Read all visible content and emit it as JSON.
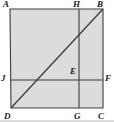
{
  "figure": {
    "name": "geometry-figure-rectangle-with-cevian",
    "type": "plane-geometry-diagram",
    "shape": "quadrilateral ABCD with interior segments",
    "background_color": "#ffffff",
    "fill_color": "#dcdcdc",
    "stroke_color": "#3c3c3c",
    "label_color": "#1a1a1a",
    "outline": {
      "A": {
        "x": 10,
        "y": 9
      },
      "B": {
        "x": 103,
        "y": 9
      },
      "C": {
        "x": 103,
        "y": 108
      },
      "D": {
        "x": 11,
        "y": 108
      }
    },
    "points": [
      {
        "id": "A",
        "label": "A",
        "x": 10,
        "y": 9,
        "label_x": 3,
        "label_y": 0,
        "position": "top-left-vertex"
      },
      {
        "id": "B",
        "label": "B",
        "x": 103,
        "y": 9,
        "label_x": 97,
        "label_y": 0,
        "position": "top-right-vertex"
      },
      {
        "id": "C",
        "label": "C",
        "x": 103,
        "y": 108,
        "label_x": 98,
        "label_y": 113,
        "position": "bottom-right-vertex"
      },
      {
        "id": "D",
        "label": "D",
        "x": 11,
        "y": 108,
        "label_x": 4,
        "label_y": 113,
        "position": "bottom-left-vertex"
      },
      {
        "id": "E",
        "label": "E",
        "x": 79,
        "y": 80,
        "label_x": 70,
        "label_y": 68,
        "position": "interior-intersection"
      },
      {
        "id": "F",
        "label": "F",
        "x": 103,
        "y": 80,
        "label_x": 105,
        "label_y": 75,
        "position": "right-edge-point"
      },
      {
        "id": "G",
        "label": "G",
        "x": 79,
        "y": 108,
        "label_x": 74,
        "label_y": 113,
        "position": "bottom-edge-point"
      },
      {
        "id": "H",
        "label": "H",
        "x": 79,
        "y": 9,
        "label_x": 74,
        "label_y": 0,
        "position": "top-edge-point"
      },
      {
        "id": "J",
        "label": "J",
        "x": 10,
        "y": 80,
        "label_x": 2,
        "label_y": 75,
        "position": "left-edge-point"
      }
    ],
    "segments": [
      {
        "name": "segment-HG-vertical",
        "from": "H",
        "to": "G",
        "x1": 79,
        "y1": 9,
        "x2": 79,
        "y2": 108
      },
      {
        "name": "segment-JF-horizontal",
        "from": "J",
        "to": "F",
        "x1": 10,
        "y1": 80,
        "x2": 103,
        "y2": 80
      },
      {
        "name": "segment-DB-diagonal",
        "from": "D",
        "to": "B",
        "x1": 11,
        "y1": 108,
        "x2": 103,
        "y2": 9
      }
    ],
    "baseline_rule": {
      "name": "bottom-rule",
      "x1": 0,
      "y1": 121,
      "x2": 114,
      "y2": 121
    }
  }
}
